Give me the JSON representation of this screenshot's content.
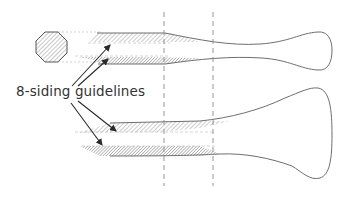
{
  "diagram": {
    "label": "8-siding guidelines",
    "colors": {
      "outline": "#6e6e6e",
      "arrow": "#2a2a2a",
      "hatch": "#9a9a9a",
      "dashed": "#8a8a8a",
      "text": "#333333"
    },
    "components": [
      "octagon-cross-section",
      "upper-tapered-shaft",
      "lower-flared-shaft",
      "dashed-reference-lines",
      "guideline-arrows"
    ]
  }
}
